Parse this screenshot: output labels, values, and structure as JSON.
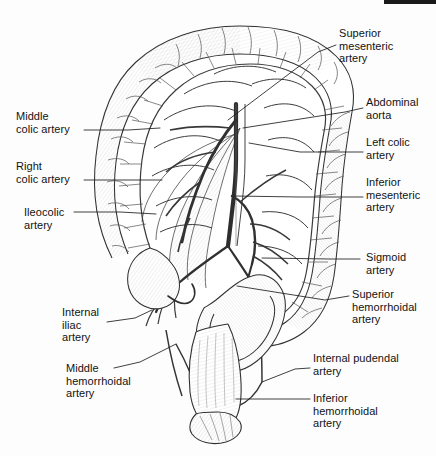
{
  "figure": {
    "style": "black-and-white pen-and-ink line drawing with stippled shading",
    "background_color": "#fdfdfd",
    "ink_color": "#1a1a1a",
    "line_color": "#2a2a2a"
  },
  "labels": [
    {
      "id": "superior-mesenteric-artery",
      "text": "Superior\nmesenteric\nartery",
      "side": "right",
      "x": 339,
      "y": 27,
      "leader": [
        [
          336,
          45
        ],
        [
          318,
          52
        ],
        [
          228,
          120
        ]
      ]
    },
    {
      "id": "abdominal-aorta",
      "text": "Abdominal\naorta",
      "side": "right",
      "x": 366,
      "y": 96,
      "leader": [
        [
          363,
          108
        ],
        [
          345,
          112
        ],
        [
          243,
          128
        ]
      ]
    },
    {
      "id": "left-colic-artery",
      "text": "Left colic\nartery",
      "side": "right",
      "x": 366,
      "y": 136,
      "leader": [
        [
          363,
          152
        ],
        [
          300,
          152
        ],
        [
          249,
          143
        ]
      ]
    },
    {
      "id": "inferior-mesenteric-artery",
      "text": "Inferior\nmesenteric\nartery",
      "side": "right",
      "x": 366,
      "y": 176,
      "leader": [
        [
          363,
          197
        ],
        [
          300,
          197
        ],
        [
          234,
          196
        ]
      ]
    },
    {
      "id": "sigmoid-artery",
      "text": "Sigmoid\nartery",
      "side": "right",
      "x": 366,
      "y": 251,
      "leader": [
        [
          360,
          259
        ],
        [
          330,
          259
        ],
        [
          262,
          258
        ]
      ]
    },
    {
      "id": "superior-hemorrhoidal-artery",
      "text": "Superior\nhemorrhoidal\nartery",
      "side": "right",
      "x": 352,
      "y": 288,
      "leader": [
        [
          349,
          296
        ],
        [
          325,
          300
        ],
        [
          237,
          286
        ]
      ]
    },
    {
      "id": "internal-pudendal-artery",
      "text": "Internal pudendal\nartery",
      "side": "right",
      "x": 313,
      "y": 352,
      "leader": [
        [
          310,
          368
        ],
        [
          295,
          369
        ],
        [
          262,
          382
        ]
      ]
    },
    {
      "id": "inferior-hemorrhoidal-artery",
      "text": "Inferior\nhemorrhoidal\nartery",
      "side": "right",
      "x": 313,
      "y": 392,
      "leader": [
        [
          310,
          399
        ],
        [
          265,
          399
        ],
        [
          236,
          399
        ]
      ]
    },
    {
      "id": "middle-colic-artery",
      "text": "Middle\ncolic artery",
      "side": "left",
      "x": 16,
      "y": 110,
      "leader": [
        [
          84,
          130
        ],
        [
          128,
          130
        ],
        [
          160,
          128
        ]
      ]
    },
    {
      "id": "right-colic-artery",
      "text": "Right\ncolic artery",
      "side": "left",
      "x": 16,
      "y": 160,
      "leader": [
        [
          84,
          180
        ],
        [
          130,
          180
        ],
        [
          162,
          180
        ]
      ]
    },
    {
      "id": "ileocolic-artery",
      "text": "Ileocolic\nartery",
      "side": "left",
      "x": 24,
      "y": 206,
      "leader": [
        [
          74,
          212
        ],
        [
          120,
          212
        ],
        [
          156,
          214
        ]
      ]
    },
    {
      "id": "internal-iliac-artery",
      "text": "Internal\niliac\nartery",
      "side": "left",
      "x": 62,
      "y": 306,
      "leader": [
        [
          107,
          322
        ],
        [
          135,
          318
        ],
        [
          152,
          310
        ]
      ]
    },
    {
      "id": "middle-hemorrhoidal-artery",
      "text": "Middle\nhemorrhoidal\nartery",
      "side": "left",
      "x": 66,
      "y": 362,
      "leader": [
        [
          114,
          368
        ],
        [
          140,
          362
        ],
        [
          176,
          344
        ]
      ]
    }
  ]
}
